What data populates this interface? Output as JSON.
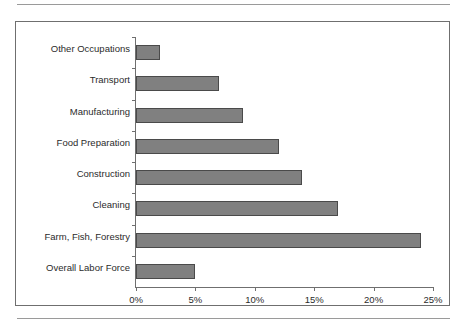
{
  "chart_data": {
    "type": "bar",
    "orientation": "horizontal",
    "title": "",
    "xlabel": "",
    "ylabel": "",
    "xlim": [
      0,
      25
    ],
    "grid": false,
    "legend": "none",
    "tick_suffix": "%",
    "xticks": [
      "0%",
      "5%",
      "10%",
      "15%",
      "20%",
      "25%"
    ],
    "xtick_values": [
      0,
      5,
      10,
      15,
      20,
      25
    ],
    "categories": [
      "Other Occupations",
      "Transport",
      "Manufacturing",
      "Food Preparation",
      "Construction",
      "Cleaning",
      "Farm, Fish, Forestry",
      "Overall Labor Force"
    ],
    "values": [
      2,
      7,
      9,
      12,
      14,
      17,
      24,
      5
    ],
    "bar_color": "#808080",
    "bar_border_color": "#4a4a4a",
    "axis_color": "#6f6f6f",
    "text_color": "#2b2b2b",
    "background": "#ffffff"
  }
}
